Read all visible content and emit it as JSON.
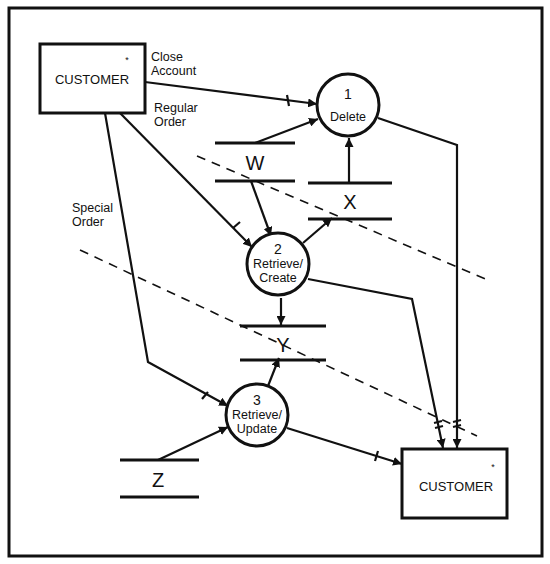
{
  "diagram": {
    "type": "data-flow-diagram",
    "colors": {
      "ink": "#111111",
      "background": "#ffffff"
    },
    "entities": [
      {
        "id": "customer-source",
        "label": "CUSTOMER",
        "marker": "*"
      },
      {
        "id": "customer-sink",
        "label": "CUSTOMER",
        "marker": "*"
      }
    ],
    "processes": [
      {
        "id": "p1",
        "number": "1",
        "name_lines": [
          "Delete"
        ]
      },
      {
        "id": "p2",
        "number": "2",
        "name_lines": [
          "Retrieve/",
          "Create"
        ]
      },
      {
        "id": "p3",
        "number": "3",
        "name_lines": [
          "Retrieve/",
          "Update"
        ]
      }
    ],
    "stores": [
      {
        "id": "W",
        "label": "W"
      },
      {
        "id": "X",
        "label": "X"
      },
      {
        "id": "Y",
        "label": "Y"
      },
      {
        "id": "Z",
        "label": "Z"
      }
    ],
    "flows": [
      {
        "from": "customer-source",
        "to": "p1",
        "label_lines": [
          "Close",
          "Account"
        ]
      },
      {
        "from": "customer-source",
        "to": "p2",
        "label_lines": [
          "Regular",
          "Order"
        ]
      },
      {
        "from": "customer-source",
        "to": "p3",
        "label_lines": [
          "Special",
          "Order"
        ]
      },
      {
        "from": "W",
        "to": "p1"
      },
      {
        "from": "W",
        "to": "p2"
      },
      {
        "from": "X",
        "to": "p1"
      },
      {
        "from": "p2",
        "to": "X"
      },
      {
        "from": "p2",
        "to": "Y"
      },
      {
        "from": "p3",
        "to": "Y"
      },
      {
        "from": "Z",
        "to": "p3"
      },
      {
        "from": "p1",
        "to": "customer-sink"
      },
      {
        "from": "p2",
        "to": "customer-sink"
      },
      {
        "from": "p3",
        "to": "customer-sink"
      }
    ],
    "partition_lines": 2
  }
}
